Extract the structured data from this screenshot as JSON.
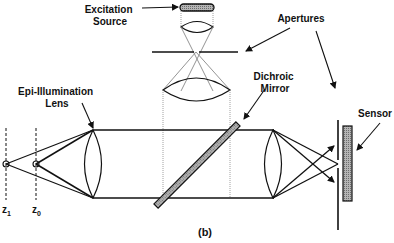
{
  "figure": {
    "caption": "(b)",
    "labels": {
      "excitation_line1": "Excitation",
      "excitation_line2": "Source",
      "apertures": "Apertures",
      "dichroic_line1": "Dichroic",
      "dichroic_line2": "Mirror",
      "epi_line1": "Epi-Illumination",
      "epi_line2": "Lens",
      "sensor": "Sensor"
    },
    "planes": [
      {
        "name": "z",
        "sub": "1"
      },
      {
        "name": "z",
        "sub": "0"
      }
    ],
    "colors": {
      "line": "#111111",
      "dotted": "#888888",
      "fill_gray": "#9a9a9a"
    }
  }
}
